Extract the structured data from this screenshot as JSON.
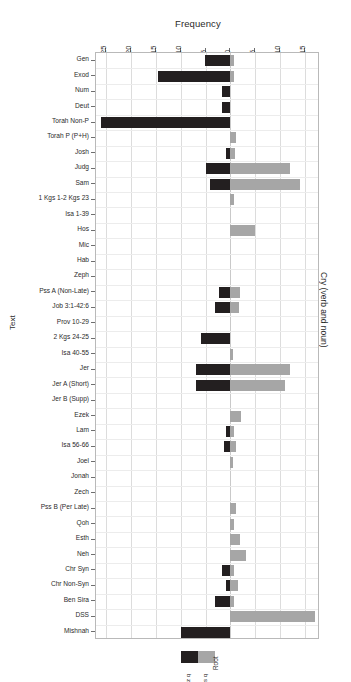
{
  "chart_data": {
    "type": "bar",
    "orientation": "horizontal-diverging",
    "title": "",
    "xlabel": "Frequency",
    "ylabel": "Text",
    "right_axis_label": "Cry (verb and noun)",
    "grid": true,
    "legend_position": "bottom",
    "legend_title": "Root",
    "xlim": [
      -27,
      18
    ],
    "xticks": [
      -25,
      -20,
      -15,
      -10,
      -5,
      0,
      5,
      10,
      15
    ],
    "xtick_labels": [
      "25",
      "20",
      "15",
      "10",
      "5",
      "0",
      "5",
      "10",
      "15"
    ],
    "colors": {
      "left_series": "#231f20",
      "right_series": "#a6a6a6",
      "grid": "#dcdcdc",
      "frame": "#b9b9b9"
    },
    "categories": [
      "Gen",
      "Exod",
      "Num",
      "Deut",
      "Torah Non-P",
      "Torah P (P+H)",
      "Josh",
      "Judg",
      "Sam",
      "1 Kgs 1-2 Kgs 23",
      "Isa 1-39",
      "Hos",
      "Mic",
      "Hab",
      "Zeph",
      "Pss A (Non-Late)",
      "Job 3:1-42:6",
      "Prov 10-29",
      "2 Kgs 24-25",
      "Isa 40-55",
      "Jer",
      "Jer A (Short)",
      "Jer B (Supp)",
      "Ezek",
      "Lam",
      "Isa 56-66",
      "Joel",
      "Jonah",
      "Zech",
      "Pss B (Per Late)",
      "Qoh",
      "Esth",
      "Neh",
      "Chr Syn",
      "Chr Non-Syn",
      "Ben Sira",
      "DSS",
      "Mishnah"
    ],
    "series": [
      {
        "name": "z q",
        "side": "left",
        "color": "#231f20",
        "values": [
          5.2,
          14.5,
          1.6,
          1.6,
          26.0,
          0,
          0.9,
          5.0,
          4.0,
          0,
          0,
          0,
          0,
          0,
          0,
          2.2,
          3.0,
          0,
          6.0,
          0,
          7.0,
          7.0,
          0,
          0,
          0.8,
          1.2,
          0,
          0,
          0,
          0,
          0,
          0,
          0,
          1.6,
          0.8,
          3.0,
          0,
          10.0
        ]
      },
      {
        "name": "s q",
        "side": "right",
        "color": "#a6a6a6",
        "values": [
          0.8,
          0.8,
          0,
          0,
          0,
          1.2,
          1.0,
          12.0,
          14.0,
          0.7,
          0,
          5.0,
          0,
          0,
          0,
          2.0,
          1.8,
          0,
          0,
          0.6,
          12.0,
          11.0,
          0,
          2.2,
          0.8,
          1.2,
          0.6,
          0,
          0,
          1.2,
          0.7,
          2.0,
          3.2,
          0.8,
          1.6,
          0.8,
          17.0,
          0
        ]
      }
    ]
  },
  "legend": {
    "title": "Root",
    "entries": [
      {
        "label": "z q",
        "color": "#231f20"
      },
      {
        "label": "s q",
        "color": "#a6a6a6"
      }
    ]
  },
  "axes": {
    "x_title": "Frequency",
    "y_title": "Text",
    "right_title": "Cry (verb and noun)"
  }
}
